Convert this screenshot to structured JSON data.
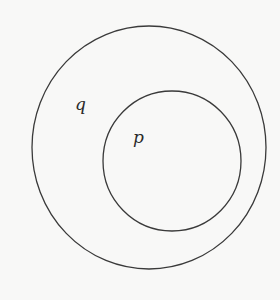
{
  "diagram": {
    "type": "euler",
    "stroke_color": "#3a3a3a",
    "background_color": "#f8f8f7",
    "sets": [
      {
        "id": "q",
        "label": "q",
        "shape": "ellipse",
        "cx": 149,
        "cy": 147.5,
        "rx": 117,
        "ry": 121.5,
        "label_x": 75,
        "label_y": 96
      },
      {
        "id": "p",
        "label": "p",
        "shape": "ellipse",
        "cx": 172,
        "cy": 161,
        "rx": 69,
        "ry": 70,
        "label_x": 133,
        "label_y": 129
      }
    ],
    "relationships": [
      {
        "subset": "p",
        "superset": "q"
      }
    ]
  }
}
